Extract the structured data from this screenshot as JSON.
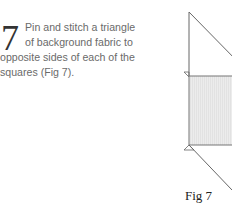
{
  "step": {
    "number": "7",
    "lines": [
      "Pin and stitch a triangle",
      "of background fabric to",
      "opposite sides of each of the",
      "squares (Fig 7)."
    ]
  },
  "figure": {
    "caption": "Fig 7",
    "fill_color": "#e8e8e8",
    "line_color": "#555555"
  }
}
